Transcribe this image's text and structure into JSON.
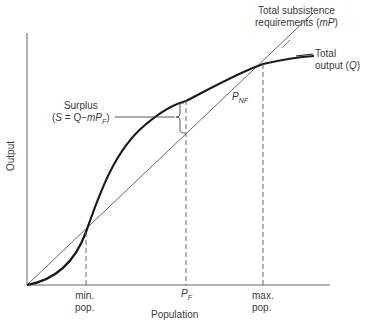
{
  "diagram": {
    "axes": {
      "x_label": "Population",
      "y_label": "Output"
    },
    "curves": {
      "subsistence": {
        "label_line1": "Total subsistence",
        "label_line2_prefix": "requirements (",
        "label_line2_var": "mP",
        "label_line2_suffix": ")"
      },
      "output": {
        "label_line1": "Total",
        "label_line2_prefix": "output (",
        "label_line2_var": "Q",
        "label_line2_suffix": ")"
      }
    },
    "surplus": {
      "line1": "Surplus",
      "line2_prefix": "(",
      "line2_S": "S",
      "line2_mid": " = Q−",
      "line2_m": "mP",
      "line2_sub": "F",
      "line2_suffix": ")"
    },
    "pnf": {
      "main": "P",
      "sub": "NF"
    },
    "x_ticks": {
      "min_line1": "min.",
      "min_line2": "pop.",
      "pf_main": "P",
      "pf_sub": "F",
      "max_line1": "max.",
      "max_line2": "pop."
    },
    "colors": {
      "curve": "#1a1a1a",
      "line": "#555555",
      "axis": "#555555"
    }
  }
}
